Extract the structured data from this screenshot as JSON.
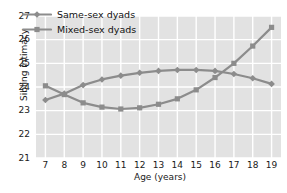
{
  "chart_data": {
    "type": "line",
    "title": "",
    "xlabel": "Age (years)",
    "ylabel": "Sibling intimacy",
    "x": [
      7,
      8,
      9,
      10,
      11,
      12,
      13,
      14,
      15,
      16,
      17,
      18,
      19
    ],
    "xticklabels": [
      "7",
      "8",
      "9",
      "10",
      "11",
      "12",
      "13",
      "14",
      "15",
      "16",
      "17",
      "18",
      "19"
    ],
    "yticklabels": [
      "21",
      "22",
      "23",
      "24",
      "25",
      "26",
      "27"
    ],
    "yticks": [
      21,
      22,
      23,
      24,
      25,
      26,
      27
    ],
    "xlim": [
      6.5,
      19.5
    ],
    "ylim": [
      21,
      27
    ],
    "grid": true,
    "legend_position": "upper-left",
    "series": [
      {
        "name": "Same-sex dyads",
        "marker": "diamond",
        "color": "#8c8c8c",
        "values": [
          23.45,
          23.72,
          24.08,
          24.32,
          24.48,
          24.6,
          24.68,
          24.72,
          24.72,
          24.68,
          24.55,
          24.37,
          24.13
        ]
      },
      {
        "name": "Mixed-sex dyads",
        "marker": "square",
        "color": "#8c8c8c",
        "values": [
          24.05,
          23.68,
          23.33,
          23.15,
          23.07,
          23.12,
          23.27,
          23.5,
          23.88,
          24.4,
          25.0,
          25.73,
          26.52
        ]
      }
    ]
  },
  "legend": {
    "items": [
      {
        "label": "Same-sex dyads",
        "marker": "diamond"
      },
      {
        "label": "Mixed-sex dyads",
        "marker": "square"
      }
    ]
  },
  "colors": {
    "plot_background": "#e2e2e2",
    "gridline": "#ffffff",
    "series_line": "#8c8c8c",
    "text": "#1a1a1a"
  }
}
